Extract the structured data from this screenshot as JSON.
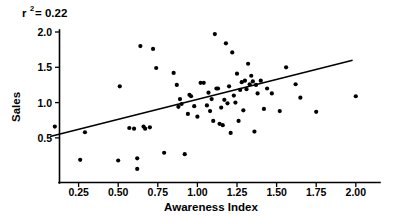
{
  "chart_data": {
    "type": "scatter",
    "title": "",
    "subtitle": "",
    "xlabel": "Awareness Index",
    "ylabel": "Sales",
    "xlim": [
      0.06,
      2.09
    ],
    "ylim": [
      0.0,
      2.05
    ],
    "grid": false,
    "legend": null,
    "xticks": [
      0.25,
      0.5,
      0.75,
      1.0,
      1.25,
      1.5,
      1.75,
      2.0
    ],
    "xticklabels": [
      "0.25",
      "0.50",
      "0.75",
      "1.00",
      "1.25",
      "1.50",
      "1.75",
      "2.00"
    ],
    "yticks": [
      0.5,
      1.0,
      1.5,
      2.0
    ],
    "yticklabels": [
      "0.5",
      "1.0",
      "1.5",
      "2.0"
    ],
    "annotations": [
      {
        "name": "r-squared",
        "text": "r2= 0.22",
        "display_base": "r",
        "display_sup": "2",
        "display_rest": "= 0.22",
        "value": 0.22,
        "x": 0.12,
        "y": 2.14
      }
    ],
    "series": [
      {
        "name": "observations",
        "type": "scatter",
        "marker": "circle",
        "color": "#000000",
        "points": [
          [
            0.1,
            0.66
          ],
          [
            0.26,
            0.19
          ],
          [
            0.29,
            0.58
          ],
          [
            0.5,
            0.18
          ],
          [
            0.51,
            1.23
          ],
          [
            0.57,
            0.64
          ],
          [
            0.6,
            0.63
          ],
          [
            0.62,
            0.21
          ],
          [
            0.62,
            0.06
          ],
          [
            0.64,
            1.8
          ],
          [
            0.66,
            0.66
          ],
          [
            0.67,
            0.63
          ],
          [
            0.7,
            0.65
          ],
          [
            0.72,
            1.76
          ],
          [
            0.74,
            1.49
          ],
          [
            0.79,
            0.29
          ],
          [
            0.85,
            1.42
          ],
          [
            0.87,
            1.25
          ],
          [
            0.88,
            0.94
          ],
          [
            0.89,
            1.05
          ],
          [
            0.9,
            0.98
          ],
          [
            0.92,
            0.27
          ],
          [
            0.94,
            0.84
          ],
          [
            0.95,
            1.11
          ],
          [
            0.96,
            1.09
          ],
          [
            0.98,
            0.95
          ],
          [
            1.0,
            0.8
          ],
          [
            1.02,
            1.28
          ],
          [
            1.04,
            1.28
          ],
          [
            1.06,
            0.96
          ],
          [
            1.07,
            1.14
          ],
          [
            1.08,
            0.88
          ],
          [
            1.09,
            1.05
          ],
          [
            1.1,
            0.74
          ],
          [
            1.11,
            1.97
          ],
          [
            1.12,
            1.2
          ],
          [
            1.13,
            1.2
          ],
          [
            1.14,
            0.7
          ],
          [
            1.15,
            0.93
          ],
          [
            1.16,
            0.68
          ],
          [
            1.17,
            1.04
          ],
          [
            1.18,
            1.84
          ],
          [
            1.19,
            0.99
          ],
          [
            1.2,
            1.23
          ],
          [
            1.21,
            0.57
          ],
          [
            1.22,
            1.71
          ],
          [
            1.23,
            1.1
          ],
          [
            1.24,
            1.0
          ],
          [
            1.25,
            1.41
          ],
          [
            1.26,
            0.74
          ],
          [
            1.27,
            1.18
          ],
          [
            1.28,
            1.29
          ],
          [
            1.29,
            0.89
          ],
          [
            1.3,
            1.31
          ],
          [
            1.31,
            1.19
          ],
          [
            1.32,
            1.55
          ],
          [
            1.33,
            1.26
          ],
          [
            1.34,
            1.38
          ],
          [
            1.35,
            1.3
          ],
          [
            1.36,
            0.59
          ],
          [
            1.37,
            1.25
          ],
          [
            1.38,
            1.13
          ],
          [
            1.4,
            1.31
          ],
          [
            1.42,
            0.91
          ],
          [
            1.44,
            1.2
          ],
          [
            1.47,
            1.13
          ],
          [
            1.52,
            0.88
          ],
          [
            1.56,
            1.5
          ],
          [
            1.62,
            1.26
          ],
          [
            1.65,
            1.07
          ],
          [
            1.75,
            0.87
          ],
          [
            2.0,
            1.09
          ]
        ]
      }
    ],
    "fit_line": {
      "name": "regression-line",
      "color": "#000000",
      "x0": 0.07,
      "y0": 0.52,
      "x1": 1.98,
      "y1": 1.6,
      "slope": 0.565,
      "intercept": 0.48
    }
  }
}
